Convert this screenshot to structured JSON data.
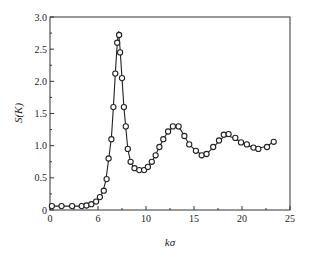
{
  "chart_data": {
    "type": "line",
    "title": "",
    "xlabel": "kσ",
    "ylabel": "S(K)",
    "xlim": [
      0,
      25
    ],
    "ylim": [
      0,
      3.0
    ],
    "grid": false,
    "x_ticks": [
      0,
      5,
      10,
      15,
      20,
      25
    ],
    "x_tick_labels": [
      "0",
      "6",
      "10",
      "15",
      "20",
      "25"
    ],
    "y_ticks": [
      0,
      0.5,
      1.0,
      1.5,
      2.0,
      2.5,
      3.0
    ],
    "y_tick_labels": [
      "0",
      "0.5",
      "1.0",
      "1.5",
      "2.0",
      "2.5",
      "3.0"
    ],
    "series": [
      {
        "name": "theory",
        "style": "line",
        "x": [
          0,
          1,
          2,
          3,
          4,
          4.5,
          5,
          5.5,
          5.8,
          6.1,
          6.4,
          6.6,
          6.8,
          7.0,
          7.15,
          7.3,
          7.5,
          7.7,
          7.9,
          8.1,
          8.4,
          8.8,
          9.3,
          9.8,
          10.2,
          10.6,
          11.0,
          11.4,
          11.8,
          12.3,
          12.8,
          13.2,
          13.6,
          14.0,
          14.5,
          15.2,
          15.8,
          16.3,
          17.0,
          17.6,
          18.1,
          18.6,
          19.3,
          19.9,
          20.5,
          21.2,
          21.7,
          22.6,
          23.3
        ],
        "y": [
          0.06,
          0.06,
          0.06,
          0.06,
          0.07,
          0.1,
          0.15,
          0.28,
          0.45,
          0.78,
          1.12,
          1.6,
          2.12,
          2.58,
          2.78,
          2.5,
          2.05,
          1.6,
          1.28,
          0.95,
          0.74,
          0.65,
          0.62,
          0.63,
          0.67,
          0.75,
          0.86,
          0.98,
          1.1,
          1.22,
          1.29,
          1.3,
          1.25,
          1.15,
          1.02,
          0.92,
          0.86,
          0.87,
          0.97,
          1.07,
          1.14,
          1.15,
          1.11,
          1.05,
          1.01,
          0.97,
          0.96,
          0.99,
          1.06
        ]
      },
      {
        "name": "simulation",
        "style": "markers",
        "marker": "open-circle",
        "x": [
          0.2,
          1.2,
          2.3,
          3.3,
          3.8,
          4.3,
          4.8,
          5.2,
          5.6,
          5.9,
          6.1,
          6.4,
          6.6,
          6.8,
          7.0,
          7.2,
          7.3,
          7.5,
          7.7,
          7.9,
          8.1,
          8.4,
          8.8,
          9.3,
          9.8,
          10.2,
          10.6,
          11.0,
          11.4,
          11.8,
          12.3,
          12.8,
          13.4,
          14.0,
          14.5,
          15.2,
          15.8,
          16.3,
          17.0,
          17.6,
          18.1,
          18.6,
          19.3,
          19.9,
          20.5,
          21.2,
          21.7,
          22.6,
          23.3
        ],
        "y": [
          0.06,
          0.06,
          0.06,
          0.06,
          0.07,
          0.09,
          0.13,
          0.2,
          0.3,
          0.48,
          0.8,
          1.1,
          1.6,
          2.12,
          2.6,
          2.72,
          2.45,
          2.05,
          1.6,
          1.3,
          0.95,
          0.75,
          0.65,
          0.62,
          0.62,
          0.67,
          0.75,
          0.85,
          0.98,
          1.1,
          1.22,
          1.3,
          1.3,
          1.15,
          1.02,
          0.92,
          0.85,
          0.87,
          0.98,
          1.08,
          1.17,
          1.18,
          1.12,
          1.05,
          1.02,
          0.97,
          0.95,
          0.98,
          1.06
        ]
      }
    ],
    "colors": {
      "line": "#222222",
      "marker": "#222222",
      "axes": "#333333"
    }
  }
}
